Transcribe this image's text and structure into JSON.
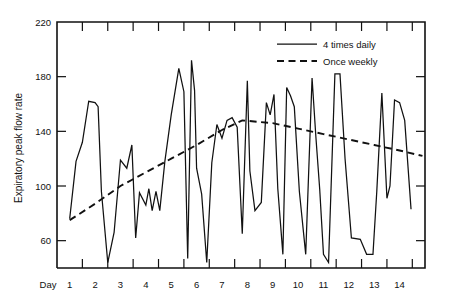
{
  "chart_data": {
    "type": "line",
    "title": "",
    "xlabel": "Day",
    "ylabel": "Expiratory peak flow rate",
    "xlim": [
      0.5,
      15.0
    ],
    "ylim": [
      40,
      220
    ],
    "grid": false,
    "legend_position": "top-right",
    "y_ticks": [
      60,
      100,
      140,
      180,
      220
    ],
    "x_ticks": [
      1,
      2,
      3,
      4,
      5,
      6,
      7,
      8,
      9,
      10,
      11,
      12,
      13,
      14
    ],
    "x_tick_labels": [
      "1",
      "2",
      "3",
      "4",
      "5",
      "6",
      "7",
      "8",
      "9",
      "10",
      "11",
      "12",
      "13",
      "14"
    ],
    "day_axis_prefix": "Day",
    "series": [
      {
        "name": "4 times daily",
        "style": "solid",
        "color": "#111111",
        "x": [
          1.0,
          1.25,
          1.5,
          1.75,
          2.0,
          2.12,
          2.25,
          2.5,
          2.75,
          3.0,
          3.25,
          3.45,
          3.6,
          3.75,
          4.0,
          4.12,
          4.25,
          4.4,
          4.55,
          4.75,
          5.0,
          5.3,
          5.5,
          5.65,
          5.8,
          5.92,
          6.0,
          6.2,
          6.4,
          6.6,
          6.8,
          7.0,
          7.2,
          7.4,
          7.6,
          7.8,
          8.0,
          8.1,
          8.3,
          8.55,
          8.75,
          8.9,
          9.05,
          9.2,
          9.4,
          9.55,
          9.7,
          9.85,
          10.05,
          10.3,
          10.55,
          10.7,
          10.85,
          11.0,
          11.2,
          11.45,
          11.65,
          11.85,
          12.1,
          12.45,
          12.7,
          12.95,
          13.1,
          13.3,
          13.5,
          13.62,
          13.8,
          14.0,
          14.2,
          14.45
        ],
        "y": [
          76,
          118,
          132,
          162,
          161,
          158,
          96,
          44,
          66,
          119,
          113,
          130,
          62,
          95,
          86,
          98,
          82,
          96,
          82,
          118,
          152,
          186,
          169,
          47,
          192,
          170,
          113,
          94,
          44,
          117,
          145,
          135,
          148,
          150,
          143,
          65,
          177,
          111,
          82,
          88,
          161,
          152,
          167,
          98,
          50,
          172,
          166,
          158,
          96,
          50,
          179,
          136,
          98,
          50,
          44,
          182,
          182,
          120,
          62,
          61,
          50,
          50,
          96,
          168,
          91,
          100,
          163,
          161,
          148,
          83
        ]
      },
      {
        "name": "Once weekly",
        "style": "dashed",
        "color": "#111111",
        "x": [
          1.0,
          2.0,
          3.0,
          4.0,
          5.0,
          6.0,
          7.0,
          7.8,
          9.0,
          10.0,
          11.0,
          12.0,
          13.0,
          14.0,
          14.9
        ],
        "y": [
          75,
          87,
          100,
          110,
          120,
          130,
          141,
          148,
          146,
          142,
          138,
          134,
          130,
          126,
          122
        ]
      }
    ],
    "legend": [
      {
        "label": "4 times daily",
        "style": "solid"
      },
      {
        "label": "Once weekly",
        "style": "dashed"
      }
    ]
  }
}
